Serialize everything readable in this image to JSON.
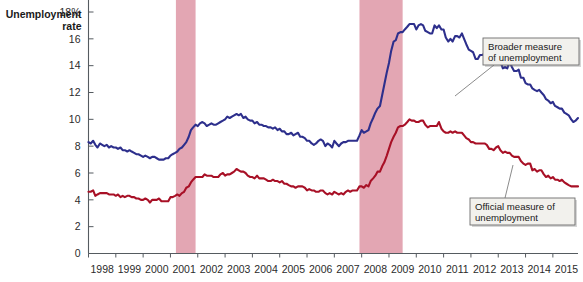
{
  "chart_data": {
    "type": "line",
    "title": "",
    "ylabel": "Unemployment rate",
    "xlabel": "",
    "ylim": [
      0,
      18
    ],
    "xlim": [
      1998.0,
      2015.92
    ],
    "grid": false,
    "legend_position": "in-plot-callouts",
    "yticks": [
      0,
      2,
      4,
      6,
      8,
      10,
      12,
      14,
      16,
      18
    ],
    "ytick_labels": [
      "0",
      "2",
      "4",
      "6",
      "8",
      "10",
      "12",
      "14",
      "16",
      "18%"
    ],
    "xticks": [
      1998,
      1999,
      2000,
      2001,
      2002,
      2003,
      2004,
      2005,
      2006,
      2007,
      2008,
      2009,
      2010,
      2011,
      2012,
      2013,
      2014,
      2015
    ],
    "xtick_labels": [
      "1998",
      "1999",
      "2000",
      "2001",
      "2002",
      "2003",
      "2004",
      "2005",
      "2006",
      "2007",
      "2008",
      "2009",
      "2010",
      "2011",
      "2012",
      "2013",
      "2014",
      "2015"
    ],
    "annotations": [
      {
        "name": "broader-measure-callout",
        "text_line1": "Broader measure",
        "text_line2": "of unemployment",
        "target_series": "Broader measure of unemployment"
      },
      {
        "name": "official-measure-callout",
        "text_line1": "Official measure of",
        "text_line2": "unemployment",
        "target_series": "Official measure of unemployment"
      }
    ],
    "shaded_regions": [
      {
        "name": "recession-2001",
        "x_start": 2001.2,
        "x_end": 2001.92,
        "color": "#e3a6b3"
      },
      {
        "name": "recession-2008",
        "x_start": 2007.92,
        "x_end": 2009.5,
        "color": "#e3a6b3"
      }
    ],
    "series": [
      {
        "name": "Broader measure of unemployment",
        "color": "#2d2f8c",
        "x": [
          1998.0,
          1998.08,
          1998.17,
          1998.25,
          1998.33,
          1998.42,
          1998.5,
          1998.58,
          1998.67,
          1998.75,
          1998.83,
          1998.92,
          1999.0,
          1999.08,
          1999.17,
          1999.25,
          1999.33,
          1999.42,
          1999.5,
          1999.58,
          1999.67,
          1999.75,
          1999.83,
          1999.92,
          2000.0,
          2000.08,
          2000.17,
          2000.25,
          2000.33,
          2000.42,
          2000.5,
          2000.58,
          2000.67,
          2000.75,
          2000.83,
          2000.92,
          2001.0,
          2001.08,
          2001.17,
          2001.25,
          2001.33,
          2001.42,
          2001.5,
          2001.58,
          2001.67,
          2001.75,
          2001.83,
          2001.92,
          2002.0,
          2002.08,
          2002.17,
          2002.25,
          2002.33,
          2002.42,
          2002.5,
          2002.58,
          2002.67,
          2002.75,
          2002.83,
          2002.92,
          2003.0,
          2003.08,
          2003.17,
          2003.25,
          2003.33,
          2003.42,
          2003.5,
          2003.58,
          2003.67,
          2003.75,
          2003.83,
          2003.92,
          2004.0,
          2004.08,
          2004.17,
          2004.25,
          2004.33,
          2004.42,
          2004.5,
          2004.58,
          2004.67,
          2004.75,
          2004.83,
          2004.92,
          2005.0,
          2005.08,
          2005.17,
          2005.25,
          2005.33,
          2005.42,
          2005.5,
          2005.58,
          2005.67,
          2005.75,
          2005.83,
          2005.92,
          2006.0,
          2006.08,
          2006.17,
          2006.25,
          2006.33,
          2006.42,
          2006.5,
          2006.58,
          2006.67,
          2006.75,
          2006.83,
          2006.92,
          2007.0,
          2007.08,
          2007.17,
          2007.25,
          2007.33,
          2007.42,
          2007.5,
          2007.58,
          2007.67,
          2007.75,
          2007.83,
          2007.92,
          2008.0,
          2008.08,
          2008.17,
          2008.25,
          2008.33,
          2008.42,
          2008.5,
          2008.58,
          2008.67,
          2008.75,
          2008.83,
          2008.92,
          2009.0,
          2009.08,
          2009.17,
          2009.25,
          2009.33,
          2009.42,
          2009.5,
          2009.58,
          2009.67,
          2009.75,
          2009.83,
          2009.92,
          2010.0,
          2010.08,
          2010.17,
          2010.25,
          2010.33,
          2010.42,
          2010.5,
          2010.58,
          2010.67,
          2010.75,
          2010.83,
          2010.92,
          2011.0,
          2011.08,
          2011.17,
          2011.25,
          2011.33,
          2011.42,
          2011.5,
          2011.58,
          2011.67,
          2011.75,
          2011.83,
          2011.92,
          2012.0,
          2012.08,
          2012.17,
          2012.25,
          2012.33,
          2012.42,
          2012.5,
          2012.58,
          2012.67,
          2012.75,
          2012.83,
          2012.92,
          2013.0,
          2013.08,
          2013.17,
          2013.25,
          2013.33,
          2013.42,
          2013.5,
          2013.58,
          2013.67,
          2013.75,
          2013.83,
          2013.92,
          2014.0,
          2014.08,
          2014.17,
          2014.25,
          2014.33,
          2014.42,
          2014.5,
          2014.58,
          2014.67,
          2014.75,
          2014.83,
          2014.92,
          2015.0,
          2015.08,
          2015.17,
          2015.25,
          2015.33,
          2015.42,
          2015.5,
          2015.58,
          2015.67,
          2015.75,
          2015.83,
          2015.92
        ],
        "y": [
          8.3,
          8.2,
          8.4,
          8.1,
          7.9,
          8.2,
          8.1,
          8.0,
          8.1,
          7.9,
          8.0,
          7.9,
          7.9,
          7.8,
          7.9,
          7.7,
          7.7,
          7.6,
          7.7,
          7.6,
          7.5,
          7.4,
          7.4,
          7.3,
          7.2,
          7.3,
          7.2,
          7.1,
          7.2,
          7.2,
          7.1,
          7.0,
          7.0,
          7.0,
          7.1,
          7.1,
          7.3,
          7.4,
          7.5,
          7.6,
          7.8,
          7.9,
          8.1,
          8.3,
          8.7,
          9.2,
          9.4,
          9.6,
          9.5,
          9.7,
          9.8,
          9.7,
          9.5,
          9.6,
          9.7,
          9.6,
          9.6,
          9.7,
          9.8,
          9.9,
          10.0,
          10.2,
          10.1,
          10.2,
          10.3,
          10.4,
          10.3,
          10.4,
          10.1,
          10.2,
          10.0,
          9.9,
          9.9,
          9.7,
          9.8,
          9.6,
          9.6,
          9.5,
          9.5,
          9.4,
          9.4,
          9.3,
          9.4,
          9.2,
          9.3,
          9.1,
          9.1,
          8.9,
          8.9,
          9.0,
          8.8,
          8.9,
          9.0,
          8.7,
          8.7,
          8.6,
          8.4,
          8.4,
          8.2,
          8.1,
          8.2,
          8.4,
          8.5,
          8.4,
          8.0,
          8.2,
          8.1,
          7.9,
          8.4,
          8.2,
          8.0,
          8.2,
          8.3,
          8.3,
          8.4,
          8.4,
          8.4,
          8.4,
          8.4,
          8.8,
          9.2,
          9.0,
          9.1,
          9.2,
          9.7,
          10.1,
          10.5,
          10.8,
          11.0,
          11.8,
          12.6,
          13.5,
          14.2,
          15.1,
          15.8,
          15.9,
          16.4,
          16.5,
          16.5,
          16.7,
          16.9,
          17.1,
          17.1,
          17.1,
          16.7,
          17.0,
          17.1,
          17.0,
          16.6,
          16.5,
          16.4,
          16.4,
          17.0,
          16.8,
          17.0,
          16.7,
          16.7,
          16.1,
          15.8,
          16.0,
          15.8,
          16.2,
          16.2,
          16.1,
          16.4,
          16.0,
          15.6,
          15.2,
          15.1,
          15.0,
          14.5,
          14.5,
          14.8,
          14.8,
          14.9,
          14.7,
          14.7,
          14.4,
          14.4,
          14.4,
          14.4,
          14.3,
          13.8,
          13.9,
          13.8,
          14.3,
          13.9,
          13.6,
          13.6,
          13.7,
          13.1,
          13.1,
          12.7,
          12.6,
          12.6,
          12.3,
          12.2,
          12.1,
          12.2,
          12.0,
          11.8,
          11.5,
          11.4,
          11.2,
          11.3,
          11.0,
          10.9,
          10.8,
          10.8,
          10.5,
          10.4,
          10.3,
          10.0,
          9.8,
          9.9,
          10.1
        ]
      },
      {
        "name": "Official measure of unemployment",
        "color": "#a81026",
        "x": [
          1998.0,
          1998.08,
          1998.17,
          1998.25,
          1998.33,
          1998.42,
          1998.5,
          1998.58,
          1998.67,
          1998.75,
          1998.83,
          1998.92,
          1999.0,
          1999.08,
          1999.17,
          1999.25,
          1999.33,
          1999.42,
          1999.5,
          1999.58,
          1999.67,
          1999.75,
          1999.83,
          1999.92,
          2000.0,
          2000.08,
          2000.17,
          2000.25,
          2000.33,
          2000.42,
          2000.5,
          2000.58,
          2000.67,
          2000.75,
          2000.83,
          2000.92,
          2001.0,
          2001.08,
          2001.17,
          2001.25,
          2001.33,
          2001.42,
          2001.5,
          2001.58,
          2001.67,
          2001.75,
          2001.83,
          2001.92,
          2002.0,
          2002.08,
          2002.17,
          2002.25,
          2002.33,
          2002.42,
          2002.5,
          2002.58,
          2002.67,
          2002.75,
          2002.83,
          2002.92,
          2003.0,
          2003.08,
          2003.17,
          2003.25,
          2003.33,
          2003.42,
          2003.5,
          2003.58,
          2003.67,
          2003.75,
          2003.83,
          2003.92,
          2004.0,
          2004.08,
          2004.17,
          2004.25,
          2004.33,
          2004.42,
          2004.5,
          2004.58,
          2004.67,
          2004.75,
          2004.83,
          2004.92,
          2005.0,
          2005.08,
          2005.17,
          2005.25,
          2005.33,
          2005.42,
          2005.5,
          2005.58,
          2005.67,
          2005.75,
          2005.83,
          2005.92,
          2006.0,
          2006.08,
          2006.17,
          2006.25,
          2006.33,
          2006.42,
          2006.5,
          2006.58,
          2006.67,
          2006.75,
          2006.83,
          2006.92,
          2007.0,
          2007.08,
          2007.17,
          2007.25,
          2007.33,
          2007.42,
          2007.5,
          2007.58,
          2007.67,
          2007.75,
          2007.83,
          2007.92,
          2008.0,
          2008.08,
          2008.17,
          2008.25,
          2008.33,
          2008.42,
          2008.5,
          2008.58,
          2008.67,
          2008.75,
          2008.83,
          2008.92,
          2009.0,
          2009.08,
          2009.17,
          2009.25,
          2009.33,
          2009.42,
          2009.5,
          2009.58,
          2009.67,
          2009.75,
          2009.83,
          2009.92,
          2010.0,
          2010.08,
          2010.17,
          2010.25,
          2010.33,
          2010.42,
          2010.5,
          2010.58,
          2010.67,
          2010.75,
          2010.83,
          2010.92,
          2011.0,
          2011.08,
          2011.17,
          2011.25,
          2011.33,
          2011.42,
          2011.5,
          2011.58,
          2011.67,
          2011.75,
          2011.83,
          2011.92,
          2012.0,
          2012.08,
          2012.17,
          2012.25,
          2012.33,
          2012.42,
          2012.5,
          2012.58,
          2012.67,
          2012.75,
          2012.83,
          2012.92,
          2013.0,
          2013.08,
          2013.17,
          2013.25,
          2013.33,
          2013.42,
          2013.5,
          2013.58,
          2013.67,
          2013.75,
          2013.83,
          2013.92,
          2014.0,
          2014.08,
          2014.17,
          2014.25,
          2014.33,
          2014.42,
          2014.5,
          2014.58,
          2014.67,
          2014.75,
          2014.83,
          2014.92,
          2015.0,
          2015.08,
          2015.17,
          2015.25,
          2015.33,
          2015.42,
          2015.5,
          2015.58,
          2015.67,
          2015.75,
          2015.83,
          2015.92
        ],
        "y": [
          4.6,
          4.6,
          4.7,
          4.3,
          4.4,
          4.5,
          4.5,
          4.5,
          4.5,
          4.4,
          4.4,
          4.4,
          4.3,
          4.4,
          4.2,
          4.3,
          4.2,
          4.3,
          4.3,
          4.2,
          4.2,
          4.1,
          4.1,
          4.0,
          4.0,
          4.1,
          4.0,
          3.8,
          4.0,
          4.0,
          4.0,
          4.1,
          3.9,
          3.9,
          3.9,
          3.9,
          4.2,
          4.2,
          4.3,
          4.4,
          4.3,
          4.5,
          4.6,
          4.9,
          5.0,
          5.3,
          5.5,
          5.7,
          5.7,
          5.7,
          5.7,
          5.9,
          5.8,
          5.8,
          5.8,
          5.7,
          5.7,
          5.7,
          5.9,
          6.0,
          5.8,
          5.9,
          5.9,
          6.0,
          6.1,
          6.3,
          6.2,
          6.1,
          6.1,
          6.0,
          5.8,
          5.7,
          5.7,
          5.6,
          5.8,
          5.6,
          5.6,
          5.6,
          5.5,
          5.4,
          5.4,
          5.5,
          5.4,
          5.4,
          5.3,
          5.4,
          5.2,
          5.2,
          5.1,
          5.0,
          5.0,
          4.9,
          5.0,
          5.0,
          5.0,
          4.9,
          4.7,
          4.8,
          4.7,
          4.7,
          4.6,
          4.6,
          4.7,
          4.7,
          4.5,
          4.4,
          4.5,
          4.4,
          4.6,
          4.5,
          4.4,
          4.5,
          4.4,
          4.6,
          4.7,
          4.6,
          4.7,
          4.7,
          4.7,
          5.0,
          5.0,
          4.9,
          5.1,
          5.0,
          5.4,
          5.6,
          5.8,
          6.1,
          6.1,
          6.5,
          6.8,
          7.3,
          7.8,
          8.3,
          8.7,
          9.0,
          9.4,
          9.5,
          9.5,
          9.6,
          9.8,
          10.0,
          9.9,
          9.9,
          9.8,
          9.8,
          9.9,
          9.9,
          9.6,
          9.4,
          9.5,
          9.5,
          9.5,
          9.5,
          9.8,
          9.3,
          9.1,
          9.0,
          9.0,
          9.1,
          9.0,
          9.1,
          9.0,
          9.0,
          9.0,
          8.8,
          8.6,
          8.5,
          8.3,
          8.3,
          8.2,
          8.2,
          8.2,
          8.2,
          8.2,
          8.1,
          7.8,
          7.8,
          7.7,
          7.9,
          8.0,
          7.7,
          7.5,
          7.6,
          7.5,
          7.5,
          7.3,
          7.2,
          7.2,
          7.2,
          6.9,
          6.7,
          6.6,
          6.7,
          6.7,
          6.2,
          6.3,
          6.1,
          6.2,
          6.2,
          5.9,
          5.7,
          5.8,
          5.6,
          5.7,
          5.5,
          5.5,
          5.4,
          5.5,
          5.3,
          5.2,
          5.1,
          5.0,
          5.0,
          5.0,
          5.0
        ]
      }
    ]
  }
}
